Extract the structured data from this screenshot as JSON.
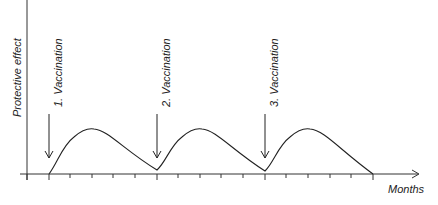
{
  "diagram": {
    "y_axis_label": "Protective effect",
    "x_axis_label": "Months",
    "vaccinations": [
      {
        "label": "1. Vaccination",
        "x": 49
      },
      {
        "label": "2. Vaccination",
        "x": 157
      },
      {
        "label": "3. Vaccination",
        "x": 265
      }
    ],
    "tick_count": 16,
    "colors": {
      "line": "#222222",
      "axis": "#333333",
      "background": "#ffffff"
    }
  }
}
